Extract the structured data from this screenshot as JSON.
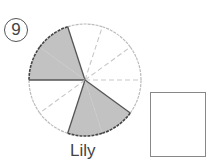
{
  "problem": {
    "number": "9",
    "number_glyph": "⑨"
  },
  "pie": {
    "center": [
      85,
      80
    ],
    "radius": 56,
    "slices": 10,
    "shaded_indices": [
      3,
      4,
      7,
      8
    ],
    "shaded_fraction": "4/10",
    "colors": {
      "shaded": "#c2c2c2",
      "outline_shaded": "#444444",
      "outline_unshaded": "#bbbbbb"
    }
  },
  "caption": "Lily",
  "answer_box": {
    "value": ""
  }
}
